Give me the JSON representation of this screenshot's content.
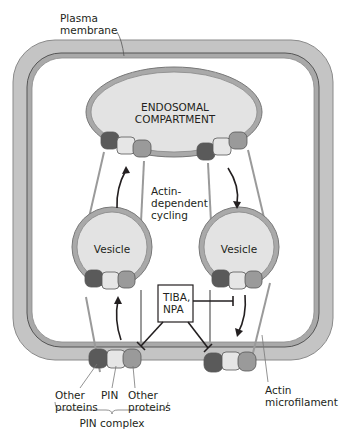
{
  "diagram": {
    "type": "cell-schematic",
    "labels": {
      "plasma_membrane": [
        "Plasma",
        "membrane"
      ],
      "endosome": [
        "ENDOSOMAL",
        "COMPARTMENT"
      ],
      "cycling": [
        "Actin-",
        "dependent",
        "cycling"
      ],
      "vesicle_left": "Vesicle",
      "vesicle_right": "Vesicle",
      "inhibitors": [
        "TIBA,",
        "NPA"
      ],
      "other_proteins_left": [
        "Other",
        "proteins"
      ],
      "pin": "PIN",
      "other_proteins_right": [
        "Other",
        "proteins"
      ],
      "pin_complex": "PIN complex",
      "actin": [
        "Actin",
        "microfilament"
      ]
    },
    "colors": {
      "cell_wall": "#bfbfbf",
      "membrane_line": "#6e6e6e",
      "interior": "#ffffff",
      "endosome_fill": "#e3e3e3",
      "protein_dark": "#5a5a5a",
      "protein_light": "#e6e6e6",
      "protein_mid": "#9a9a9a",
      "filament": "#9a9a9a",
      "arrow": "#231f20"
    }
  }
}
